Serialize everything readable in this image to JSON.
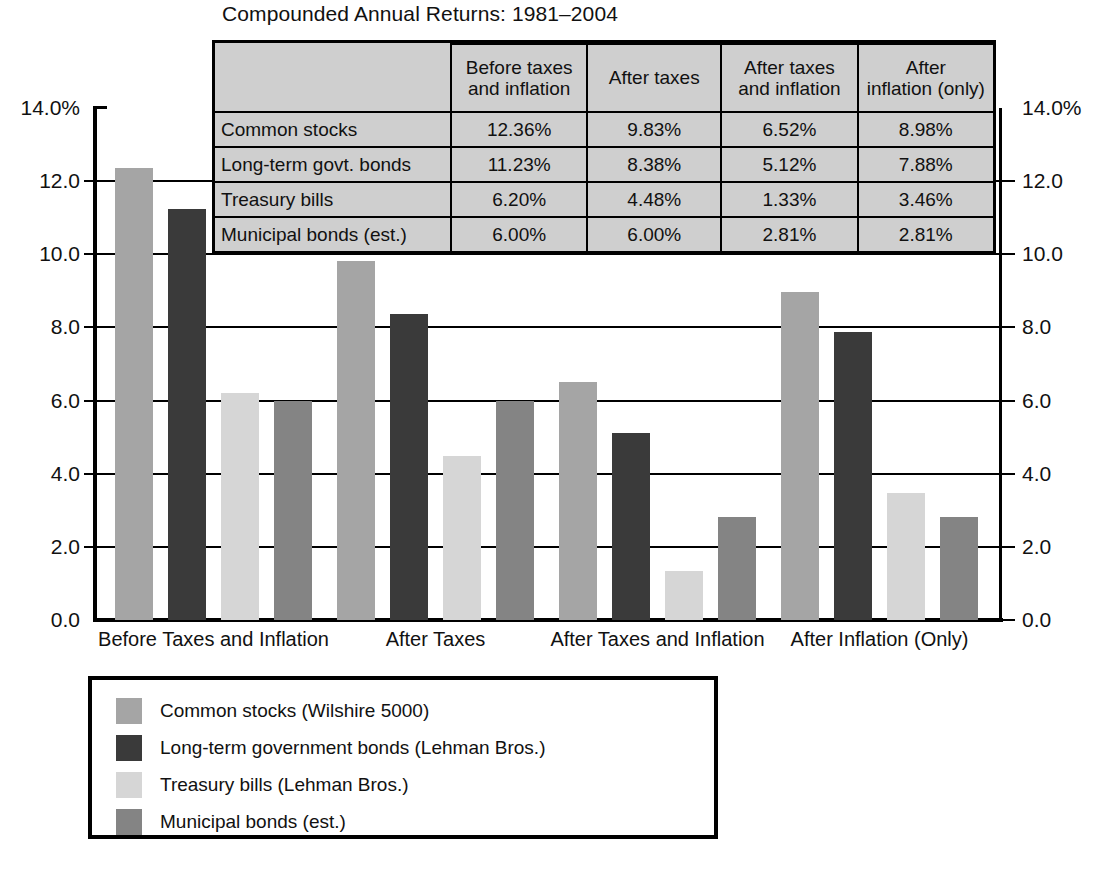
{
  "chart_data": {
    "type": "bar",
    "title": "Compounded Annual Returns: 1981–2004",
    "xlabel": "",
    "ylabel": "",
    "ylim": [
      0.0,
      14.0
    ],
    "grid": true,
    "legend_position": "bottom-left",
    "categories": [
      "Before Taxes and Inflation",
      "After Taxes",
      "After Taxes and Inflation",
      "After Inflation (Only)"
    ],
    "series": [
      {
        "name": "Common stocks (Wilshire 5000)",
        "color": "#a5a5a5",
        "values": [
          12.36,
          9.83,
          6.52,
          8.98
        ]
      },
      {
        "name": "Long-term government bonds (Lehman Bros.)",
        "color": "#3a3a3a",
        "values": [
          11.23,
          8.38,
          5.12,
          7.88
        ]
      },
      {
        "name": "Treasury bills (Lehman Bros.)",
        "color": "#d6d6d6",
        "values": [
          6.2,
          4.48,
          1.33,
          3.46
        ]
      },
      {
        "name": "Municipal bonds (est.)",
        "color": "#848484",
        "values": [
          6.0,
          6.0,
          2.81,
          2.81
        ]
      }
    ],
    "y_ticks_left": [
      "14.0%",
      "12.0",
      "10.0",
      "8.0",
      "6.0",
      "4.0",
      "2.0",
      "0.0"
    ],
    "y_ticks_right": [
      "14.0%",
      "12.0",
      "10.0",
      "8.0",
      "6.0",
      "4.0",
      "2.0",
      "0.0"
    ],
    "y_tick_values": [
      14.0,
      12.0,
      10.0,
      8.0,
      6.0,
      4.0,
      2.0,
      0.0
    ]
  },
  "table": {
    "corner_label": "",
    "headers": [
      "Before taxes\nand inflation",
      "After taxes",
      "After taxes\nand inflation",
      "After\ninflation (only)"
    ],
    "header_lines": [
      [
        "Before taxes",
        "and inflation"
      ],
      [
        "After taxes",
        ""
      ],
      [
        "After taxes",
        "and inflation"
      ],
      [
        "After",
        "inflation (only)"
      ]
    ],
    "rows": [
      {
        "label": "Common stocks",
        "values": [
          "12.36%",
          "9.83%",
          "6.52%",
          "8.98%"
        ]
      },
      {
        "label": "Long-term govt. bonds",
        "values": [
          "11.23%",
          "8.38%",
          "5.12%",
          "7.88%"
        ]
      },
      {
        "label": "Treasury bills",
        "values": [
          "6.20%",
          "4.48%",
          "1.33%",
          "3.46%"
        ]
      },
      {
        "label": "Municipal bonds (est.)",
        "values": [
          "6.00%",
          "6.00%",
          "2.81%",
          "2.81%"
        ]
      }
    ]
  },
  "legend": {
    "items": [
      {
        "label": "Common stocks (Wilshire 5000)",
        "color": "#a5a5a5"
      },
      {
        "label": "Long-term government bonds (Lehman Bros.)",
        "color": "#3a3a3a"
      },
      {
        "label": "Treasury bills (Lehman Bros.)",
        "color": "#d6d6d6"
      },
      {
        "label": "Municipal bonds (est.)",
        "color": "#848484"
      }
    ]
  }
}
